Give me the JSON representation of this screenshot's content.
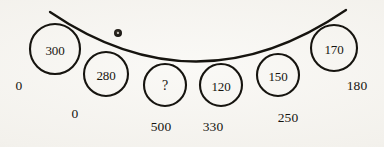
{
  "figure": {
    "background_color": "#f6f4f0",
    "ink_color": "#16140f",
    "curve": {
      "name": "sagging-curve",
      "start": [
        50,
        12
      ],
      "control": [
        197,
        112
      ],
      "end": [
        346,
        10
      ],
      "stroke_width": 2.3
    },
    "nodes": [
      {
        "id": "node-300",
        "label": "300",
        "cx": 55,
        "cy": 49,
        "r": 25
      },
      {
        "id": "node-280",
        "label": "280",
        "cx": 106,
        "cy": 74,
        "r": 22
      },
      {
        "id": "node-unknown",
        "label": "?",
        "cx": 165,
        "cy": 85,
        "r": 21
      },
      {
        "id": "node-120",
        "label": "120",
        "cx": 221,
        "cy": 85,
        "r": 21
      },
      {
        "id": "node-150",
        "label": "150",
        "cx": 278,
        "cy": 75,
        "r": 21
      },
      {
        "id": "node-170",
        "label": "170",
        "cx": 334,
        "cy": 48,
        "r": 23
      }
    ],
    "axis_labels": [
      {
        "id": "label-left-0",
        "text": "0",
        "x": 19,
        "y": 86
      },
      {
        "id": "label-right-180",
        "text": "180",
        "x": 357,
        "y": 86
      },
      {
        "id": "label-lower-0",
        "text": "0",
        "x": 75,
        "y": 114
      },
      {
        "id": "label-lower-500",
        "text": "500",
        "x": 161,
        "y": 127
      },
      {
        "id": "label-lower-330",
        "text": "330",
        "x": 213,
        "y": 127
      },
      {
        "id": "label-lower-250",
        "text": "250",
        "x": 288,
        "y": 118
      }
    ],
    "speck": {
      "id": "ink-speck",
      "x": 118,
      "y": 33,
      "r": 4
    }
  }
}
